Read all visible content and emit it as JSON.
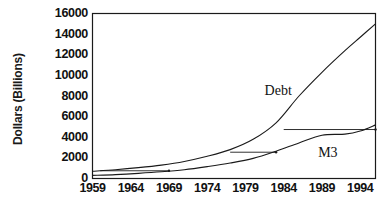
{
  "chart_data": {
    "type": "line",
    "title": "",
    "xlabel": "",
    "ylabel": "Dollars (Billions)",
    "xlim": [
      1959,
      1996
    ],
    "ylim": [
      0,
      16000
    ],
    "grid": false,
    "legend": "inline-annotations",
    "y_ticks": [
      "0",
      "2000",
      "4000",
      "6000",
      "8000",
      "10000",
      "12000",
      "14000",
      "16000"
    ],
    "y_tick_values": [
      0,
      2000,
      4000,
      6000,
      8000,
      10000,
      12000,
      14000,
      16000
    ],
    "x_ticks": [
      "1959",
      "1964",
      "1969",
      "1974",
      "1979",
      "1984",
      "1989",
      "1994"
    ],
    "x_tick_values": [
      1959,
      1964,
      1969,
      1974,
      1979,
      1984,
      1989,
      1994
    ],
    "series": [
      {
        "name": "Debt",
        "label": "Debt",
        "color": "#1a1a1a",
        "x": [
          1959,
          1962,
          1965,
          1968,
          1971,
          1974,
          1977,
          1980,
          1983,
          1986,
          1989,
          1992,
          1994,
          1996
        ],
        "values": [
          700,
          850,
          1050,
          1300,
          1650,
          2150,
          2800,
          3800,
          5400,
          8000,
          10300,
          12400,
          13700,
          15000
        ]
      },
      {
        "name": "M3",
        "label": "M3",
        "color": "#1a1a1a",
        "x": [
          1959,
          1962,
          1965,
          1968,
          1971,
          1974,
          1977,
          1980,
          1983,
          1986,
          1989,
          1992,
          1994,
          1996
        ],
        "values": [
          300,
          380,
          500,
          650,
          850,
          1150,
          1500,
          1950,
          2650,
          3450,
          4200,
          4300,
          4600,
          5200
        ]
      }
    ],
    "annotations": [
      {
        "name": "lag-connector-1",
        "y_value": 750,
        "x_start": 1960,
        "x_end": 1969,
        "note": "horizontal lag arrow"
      },
      {
        "name": "lag-connector-2",
        "y_value": 2550,
        "x_start": 1977,
        "x_end": 1983,
        "note": "horizontal lag arrow"
      },
      {
        "name": "lag-connector-3",
        "y_value": 4750,
        "x_start": 1984,
        "x_end": 1996,
        "note": "horizontal lag arrow"
      }
    ]
  }
}
